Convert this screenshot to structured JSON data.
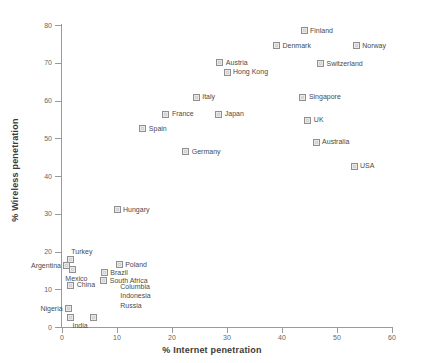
{
  "chart_data": {
    "type": "scatter",
    "title": "",
    "xlabel": "% Internet penetration",
    "ylabel": "% Wireless penetration",
    "xlim": [
      0,
      60
    ],
    "ylim": [
      0,
      80
    ],
    "xticks": [
      "0",
      "10",
      "20",
      "30",
      "40",
      "50",
      "60"
    ],
    "yticks": [
      "0",
      "10",
      "20",
      "30",
      "40",
      "50",
      "60",
      "70",
      "80"
    ],
    "grid": false,
    "legend": "none",
    "points": [
      {
        "label": "Finland",
        "x": 44.0,
        "y": 78.5,
        "label_side": "right"
      },
      {
        "label": "Denmark",
        "x": 39.0,
        "y": 74.5,
        "label_side": "right"
      },
      {
        "label": "Norway",
        "x": 53.5,
        "y": 74.5,
        "label_side": "right"
      },
      {
        "label": "Austria",
        "x": 28.7,
        "y": 70.0,
        "label_side": "right"
      },
      {
        "label": "Switzerland",
        "x": 47.0,
        "y": 69.8,
        "label_side": "right"
      },
      {
        "label": "Hong Kong",
        "x": 30.0,
        "y": 67.5,
        "label_side": "right"
      },
      {
        "label": "Italy",
        "x": 24.4,
        "y": 60.9,
        "label_side": "right"
      },
      {
        "label": "Singapore",
        "x": 43.8,
        "y": 60.9,
        "label_side": "right"
      },
      {
        "label": "France",
        "x": 18.9,
        "y": 56.4,
        "label_side": "right"
      },
      {
        "label": "Japan",
        "x": 28.5,
        "y": 56.4,
        "label_side": "right"
      },
      {
        "label": "UK",
        "x": 44.7,
        "y": 54.8,
        "label_side": "right"
      },
      {
        "label": "Spain",
        "x": 14.7,
        "y": 52.5,
        "label_side": "right"
      },
      {
        "label": "Australia",
        "x": 46.2,
        "y": 49.0,
        "label_side": "right"
      },
      {
        "label": "Germany",
        "x": 22.5,
        "y": 46.4,
        "label_side": "right"
      },
      {
        "label": "USA",
        "x": 53.1,
        "y": 42.6,
        "label_side": "right"
      },
      {
        "label": "Hungary",
        "x": 10.0,
        "y": 31.0,
        "label_side": "right"
      },
      {
        "label": "Turkey",
        "x": 1.6,
        "y": 18.0,
        "label_side": "none"
      },
      {
        "label": "Argentina",
        "x": 0.9,
        "y": 16.2,
        "label_side": "left"
      },
      {
        "label": "Poland",
        "x": 10.4,
        "y": 16.5,
        "label_side": "right"
      },
      {
        "label": "Brazil",
        "x": 7.7,
        "y": 14.4,
        "label_side": "right"
      },
      {
        "label": "Mexico",
        "x": 1.9,
        "y": 15.2,
        "label_side": "none"
      },
      {
        "label": "South Africa",
        "x": 7.6,
        "y": 12.3,
        "label_side": "right"
      },
      {
        "label": "China",
        "x": 1.6,
        "y": 11.0,
        "label_side": "right"
      },
      {
        "label": "Nigeria",
        "x": 1.2,
        "y": 4.8,
        "label_side": "left"
      },
      {
        "label": "India",
        "x": 1.5,
        "y": 2.6,
        "label_side": "none"
      },
      {
        "label": "Russia",
        "x": 5.7,
        "y": 2.6,
        "label_side": "none"
      }
    ],
    "free_labels": [
      {
        "text": "Turkey",
        "x": 1.7,
        "y": 19.8
      },
      {
        "text": "Mexico",
        "x": 0.6,
        "y": 12.6
      },
      {
        "text": "Columbia",
        "x": 10.6,
        "y": 10.7
      },
      {
        "text": "Indonesia",
        "x": 10.6,
        "y": 8.2
      },
      {
        "text": "Russia",
        "x": 10.6,
        "y": 5.6
      },
      {
        "text": "India",
        "x": 1.9,
        "y": 0.2
      }
    ]
  }
}
